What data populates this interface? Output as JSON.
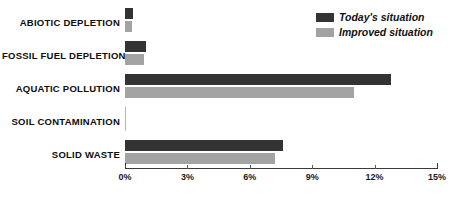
{
  "chart_data": {
    "type": "bar",
    "orientation": "horizontal",
    "title": "",
    "xlabel": "",
    "ylabel": "",
    "xlim": [
      0,
      15
    ],
    "x_tick_labels": [
      "0%",
      "3%",
      "6%",
      "9%",
      "12%",
      "15%"
    ],
    "x_ticks": [
      0,
      3,
      6,
      9,
      12,
      15
    ],
    "grid": false,
    "legend_position": "top-right",
    "categories": [
      "ABIOTIC DEPLETION",
      "FOSSIL FUEL DEPLETION",
      "AQUATIC POLLUTION",
      "SOIL CONTAMINATION",
      "SOLID WASTE"
    ],
    "series": [
      {
        "name": "Today's situation",
        "color": "#333333",
        "values": [
          0.4,
          1.0,
          12.8,
          0.0,
          7.6
        ]
      },
      {
        "name": "Improved situation",
        "color": "#a3a3a3",
        "values": [
          0.35,
          0.9,
          11.0,
          0.0,
          7.2
        ]
      }
    ]
  },
  "colors": {
    "today": "#333333",
    "improved": "#a3a3a3",
    "axis": "#3a3a3a",
    "text": "#0d0d0d",
    "background": "#ffffff"
  }
}
